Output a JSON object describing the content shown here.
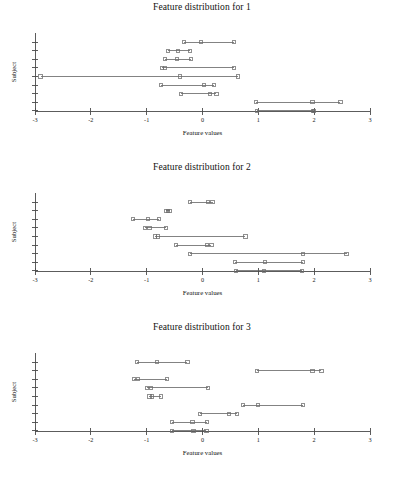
{
  "figure": {
    "panel_count": 3,
    "background": "#ffffff",
    "line_color": "#5a5a5a",
    "marker_color": "#6b6b6b",
    "axis_color": "#4a4a4a"
  },
  "panels": [
    {
      "title": "Feature distribution for 1",
      "xlabel": "Feature values",
      "ylabel": "Subject"
    },
    {
      "title": "Feature distribution for 2",
      "xlabel": "Feature values",
      "ylabel": "Subject"
    },
    {
      "title": "Feature distribution for 3",
      "xlabel": "Feature values",
      "ylabel": "Subject"
    }
  ],
  "chart_data": [
    {
      "type": "line",
      "title": "Feature distribution for 1",
      "xlabel": "Feature values",
      "ylabel": "Subject",
      "xlim": [
        -3,
        3
      ],
      "xticks": [
        -3,
        -2,
        -1,
        0,
        1,
        2,
        3
      ],
      "xticklabels": [
        "-3",
        "-2",
        "-1",
        "0",
        "1",
        "2",
        "3"
      ],
      "yticks": [
        1,
        2,
        3,
        4,
        5,
        6,
        7,
        8,
        9
      ],
      "yticklabels": [
        "",
        "",
        "",
        "",
        "",
        "",
        "",
        "",
        ""
      ],
      "grid": false,
      "legend": false,
      "marker": "square",
      "note": "Each subject row plots min, median and max feature values joined by a line.",
      "series": [
        {
          "name": "subject-1",
          "row": 1,
          "min": -0.33,
          "median": -0.02,
          "max": 0.57
        },
        {
          "name": "subject-2",
          "row": 2,
          "min": -0.62,
          "median": -0.44,
          "max": -0.23
        },
        {
          "name": "subject-3",
          "row": 3,
          "min": -0.67,
          "median": -0.45,
          "max": -0.2
        },
        {
          "name": "subject-4",
          "row": 4,
          "min": -0.72,
          "median": -0.67,
          "max": 0.57
        },
        {
          "name": "subject-5",
          "row": 5,
          "min": -2.9,
          "median": -0.4,
          "max": 0.63
        },
        {
          "name": "subject-6",
          "row": 6,
          "min": -0.75,
          "median": 0.02,
          "max": 0.2
        },
        {
          "name": "subject-7",
          "row": 7,
          "min": -0.38,
          "median": 0.14,
          "max": 0.25
        },
        {
          "name": "subject-8",
          "row": 8,
          "min": 0.96,
          "median": 1.97,
          "max": 2.47
        },
        {
          "name": "subject-9",
          "row": 9,
          "min": 0.97,
          "median": 1.98,
          "max": 2.0
        }
      ]
    },
    {
      "type": "line",
      "title": "Feature distribution for 2",
      "xlabel": "Feature values",
      "ylabel": "Subject",
      "xlim": [
        -3,
        3
      ],
      "xticks": [
        -3,
        -2,
        -1,
        0,
        1,
        2,
        3
      ],
      "xticklabels": [
        "-3",
        "-2",
        "-1",
        "0",
        "1",
        "2",
        "3"
      ],
      "yticks": [
        1,
        2,
        3,
        4,
        5,
        6,
        7,
        8,
        9
      ],
      "yticklabels": [
        "",
        "",
        "",
        "",
        "",
        "",
        "",
        "",
        ""
      ],
      "grid": false,
      "legend": false,
      "marker": "square",
      "note": "Each subject row plots min, median and max feature values joined by a line.",
      "series": [
        {
          "name": "subject-1",
          "row": 1,
          "min": -0.22,
          "median": 0.1,
          "max": 0.18
        },
        {
          "name": "subject-2",
          "row": 2,
          "min": -0.65,
          "median": -0.62,
          "max": -0.58
        },
        {
          "name": "subject-3",
          "row": 3,
          "min": -1.25,
          "median": -0.98,
          "max": -0.78
        },
        {
          "name": "subject-4",
          "row": 4,
          "min": -1.03,
          "median": -0.95,
          "max": -0.65
        },
        {
          "name": "subject-5",
          "row": 5,
          "min": -0.85,
          "median": -0.8,
          "max": 0.77
        },
        {
          "name": "subject-6",
          "row": 6,
          "min": -0.47,
          "median": 0.08,
          "max": 0.16
        },
        {
          "name": "subject-7",
          "row": 7,
          "min": -0.22,
          "median": 1.8,
          "max": 2.58
        },
        {
          "name": "subject-8",
          "row": 8,
          "min": 0.58,
          "median": 1.12,
          "max": 1.8
        },
        {
          "name": "subject-9",
          "row": 9,
          "min": 0.6,
          "median": 1.1,
          "max": 1.78
        }
      ]
    },
    {
      "type": "line",
      "title": "Feature distribution for 3",
      "xlabel": "Feature values",
      "ylabel": "Subject",
      "xlim": [
        -3,
        3
      ],
      "xticks": [
        -3,
        -2,
        -1,
        0,
        1,
        2,
        3
      ],
      "xticklabels": [
        "-3",
        "-2",
        "-1",
        "0",
        "1",
        "2",
        "3"
      ],
      "yticks": [
        1,
        2,
        3,
        4,
        5,
        6,
        7,
        8,
        9
      ],
      "yticklabels": [
        "",
        "",
        "",
        "",
        "",
        "",
        "",
        "",
        ""
      ],
      "grid": false,
      "legend": false,
      "marker": "square",
      "note": "Each subject row plots min, median and max feature values joined by a line.",
      "series": [
        {
          "name": "subject-1",
          "row": 1,
          "min": -1.18,
          "median": -0.82,
          "max": -0.27
        },
        {
          "name": "subject-2",
          "row": 2,
          "min": 0.98,
          "median": 1.97,
          "max": 2.13
        },
        {
          "name": "subject-3",
          "row": 3,
          "min": -1.22,
          "median": -1.16,
          "max": -0.63
        },
        {
          "name": "subject-4",
          "row": 4,
          "min": -1.0,
          "median": -0.92,
          "max": 0.1
        },
        {
          "name": "subject-5",
          "row": 5,
          "min": -0.95,
          "median": -0.9,
          "max": -0.75
        },
        {
          "name": "subject-6",
          "row": 6,
          "min": 0.73,
          "median": 1.0,
          "max": 1.8
        },
        {
          "name": "subject-7",
          "row": 7,
          "min": -0.05,
          "median": 0.47,
          "max": 0.62
        },
        {
          "name": "subject-8",
          "row": 8,
          "min": -0.55,
          "median": -0.18,
          "max": 0.08
        },
        {
          "name": "subject-9",
          "row": 9,
          "min": -0.54,
          "median": -0.16,
          "max": 0.07
        }
      ]
    }
  ]
}
